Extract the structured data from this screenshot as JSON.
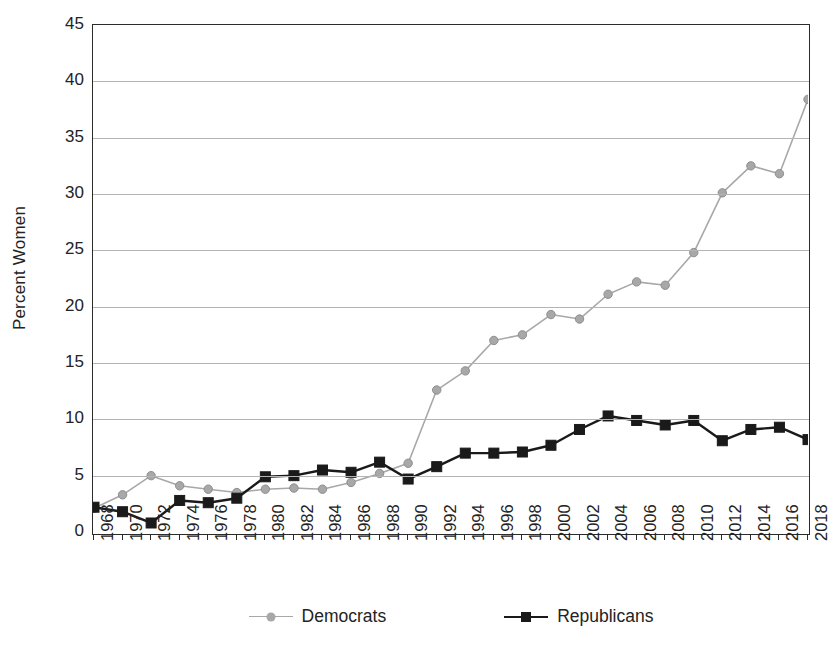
{
  "chart_data": {
    "type": "line",
    "title": "",
    "xlabel": "",
    "ylabel": "Percent Women",
    "xlim": [
      1968,
      2018
    ],
    "ylim": [
      0,
      45
    ],
    "ytick_step": 5,
    "xtick_step": 2,
    "grid": true,
    "legend_position": "bottom",
    "categories": [
      "1968",
      "1970",
      "1972",
      "1974",
      "1976",
      "1978",
      "1980",
      "1982",
      "1984",
      "1986",
      "1988",
      "1990",
      "1992",
      "1994",
      "1996",
      "1998",
      "2000",
      "2002",
      "2004",
      "2006",
      "2008",
      "2010",
      "2012",
      "2014",
      "2016",
      "2018"
    ],
    "x": [
      1968,
      1970,
      1972,
      1974,
      1976,
      1978,
      1980,
      1982,
      1984,
      1986,
      1988,
      1990,
      1992,
      1994,
      1996,
      1998,
      2000,
      2002,
      2004,
      2006,
      2008,
      2010,
      2012,
      2014,
      2016,
      2018
    ],
    "yticks": [
      0,
      5,
      10,
      15,
      20,
      25,
      30,
      35,
      40,
      45
    ],
    "series": [
      {
        "name": "Democrats",
        "color": "#a8a8a8",
        "marker": "circle",
        "values": [
          2.1,
          3.3,
          5.0,
          4.1,
          3.8,
          3.5,
          3.8,
          3.9,
          3.8,
          4.4,
          5.2,
          6.1,
          12.6,
          14.3,
          17.0,
          17.5,
          19.3,
          18.9,
          21.1,
          22.2,
          21.9,
          24.8,
          30.1,
          32.5,
          31.8,
          38.4
        ]
      },
      {
        "name": "Republicans",
        "color": "#1a1a1a",
        "marker": "square",
        "values": [
          2.2,
          1.8,
          0.8,
          2.8,
          2.6,
          3.0,
          4.9,
          5.0,
          5.5,
          5.3,
          6.2,
          4.7,
          5.8,
          7.0,
          7.0,
          7.1,
          7.7,
          9.1,
          10.3,
          9.9,
          9.5,
          9.9,
          8.1,
          9.1,
          9.3,
          8.2
        ]
      }
    ]
  },
  "legend": {
    "items": [
      {
        "label": "Democrats"
      },
      {
        "label": "Republicans"
      }
    ]
  },
  "axis": {
    "y_title": "Percent Women"
  }
}
